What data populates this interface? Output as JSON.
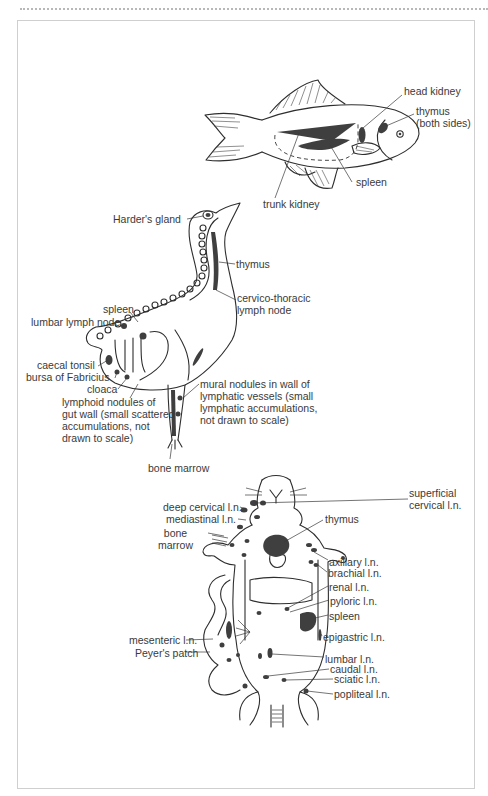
{
  "figure": {
    "accent_color": "#3f3f3f",
    "frame_color": "#cfcfcf"
  },
  "fish": {
    "labels": [
      {
        "id": "head-kidney",
        "text": "head kidney",
        "x": 404,
        "y": 90
      },
      {
        "id": "thymus",
        "text": "thymus\n(both sides)",
        "x": 416,
        "y": 109
      },
      {
        "id": "spleen",
        "text": "spleen",
        "x": 356,
        "y": 180
      },
      {
        "id": "trunk-kidney",
        "text": "trunk kidney",
        "x": 263,
        "y": 200
      }
    ]
  },
  "bird": {
    "labels": [
      {
        "id": "harders-gland",
        "text": "Harder's gland",
        "x": 113,
        "y": 217,
        "align": "right",
        "w": 72
      },
      {
        "id": "thymus",
        "text": "thymus",
        "x": 236,
        "y": 258
      },
      {
        "id": "cervico-thoracic-lymph-node",
        "text": "cervico-thoracic\nlymph node",
        "x": 237,
        "y": 292
      },
      {
        "id": "spleen",
        "text": "spleen",
        "x": 103,
        "y": 306
      },
      {
        "id": "lumbar-lymph-node",
        "text": "lumbar lymph node",
        "x": 31,
        "y": 319
      },
      {
        "id": "caecal-tonsil",
        "text": "caecal tonsil",
        "x": 37,
        "y": 360
      },
      {
        "id": "bursa-of-fabricius",
        "text": "bursa of Fabricius",
        "x": 26,
        "y": 372
      },
      {
        "id": "cloaca",
        "text": "cloaca",
        "x": 87,
        "y": 384
      },
      {
        "id": "lymphoid-nodules-gut",
        "text": "lymphoid nodules of\ngut wall (small scattered\naccumulations, not\ndrawn to scale)",
        "x": 62,
        "y": 397
      },
      {
        "id": "mural-nodules",
        "text": "mural nodules in wall of\nlymphatic vessels (small\nlymphatic accumulations,\nnot drawn to scale)",
        "x": 200,
        "y": 379
      },
      {
        "id": "bone-marrow",
        "text": "bone marrow",
        "x": 148,
        "y": 462
      }
    ]
  },
  "mouse": {
    "labels": [
      {
        "id": "superficial-cervical-ln",
        "text": "superficial\ncervical l.n.",
        "x": 409,
        "y": 490
      },
      {
        "id": "deep-cervical-ln",
        "text": "deep cervical l.n.",
        "x": 163,
        "y": 503
      },
      {
        "id": "mediastinal-ln",
        "text": "mediastinal l.n.",
        "x": 166,
        "y": 516
      },
      {
        "id": "thymus",
        "text": "thymus",
        "x": 325,
        "y": 515
      },
      {
        "id": "bone-marrow",
        "text": "bone\nmarrow",
        "x": 155,
        "y": 529
      },
      {
        "id": "axillary-ln",
        "text": "axillary l.n.",
        "x": 329,
        "y": 557
      },
      {
        "id": "brachial-ln",
        "text": "brachial l.n.",
        "x": 328,
        "y": 569
      },
      {
        "id": "renal-ln",
        "text": "renal l.n.",
        "x": 329,
        "y": 582
      },
      {
        "id": "pyloric-ln",
        "text": "pyloric l.n.",
        "x": 330,
        "y": 596
      },
      {
        "id": "spleen",
        "text": "spleen",
        "x": 329,
        "y": 611
      },
      {
        "id": "epigastric-ln",
        "text": "epigastric l.n.",
        "x": 323,
        "y": 632
      },
      {
        "id": "mesenteric-ln",
        "text": "mesenteric l.n.",
        "x": 129,
        "y": 634
      },
      {
        "id": "peyers-patch",
        "text": "Peyer's patch",
        "x": 135,
        "y": 648
      },
      {
        "id": "lumbar-ln",
        "text": "lumbar l.n.",
        "x": 325,
        "y": 654
      },
      {
        "id": "caudal-ln",
        "text": "caudal l.n.",
        "x": 330,
        "y": 665
      },
      {
        "id": "sciatic-ln",
        "text": "sciatic l.n.",
        "x": 334,
        "y": 675
      },
      {
        "id": "popliteal-ln",
        "text": "popliteal l.n.",
        "x": 334,
        "y": 690
      }
    ]
  }
}
